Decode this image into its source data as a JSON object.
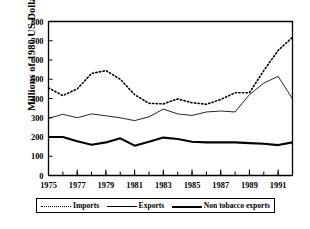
{
  "chart_data": {
    "type": "line",
    "title": "",
    "xlabel": "",
    "ylabel": "Millions of 1980 US Dollars",
    "xlim": [
      1975,
      1992
    ],
    "ylim": [
      0,
      800
    ],
    "ytick_step": 100,
    "xtick_step": 1,
    "xtick_label_step": 2,
    "grid": false,
    "legend_position": "below-plot",
    "yticks": [
      "0",
      "100",
      "200",
      "300",
      "400",
      "500",
      "600",
      "700",
      "800"
    ],
    "xticks": [
      "1975",
      "1977",
      "1979",
      "1981",
      "1983",
      "1985",
      "1987",
      "1989",
      "1991"
    ],
    "x": [
      1975,
      1976,
      1977,
      1978,
      1979,
      1980,
      1981,
      1982,
      1983,
      1984,
      1985,
      1986,
      1987,
      1988,
      1989,
      1990,
      1991,
      1992
    ],
    "series": [
      {
        "name": "Imports",
        "style": "dotted",
        "values": [
          455,
          415,
          450,
          530,
          545,
          500,
          420,
          375,
          372,
          398,
          378,
          370,
          395,
          430,
          430,
          545,
          650,
          718
        ]
      },
      {
        "name": "Exports",
        "style": "thin-solid",
        "values": [
          297,
          318,
          300,
          320,
          310,
          300,
          285,
          305,
          345,
          320,
          312,
          330,
          335,
          330,
          420,
          480,
          515,
          398
        ]
      },
      {
        "name": "Non tobacco exports",
        "style": "thick-solid",
        "values": [
          200,
          200,
          178,
          160,
          172,
          193,
          155,
          175,
          197,
          190,
          175,
          172,
          172,
          172,
          168,
          165,
          158,
          172
        ]
      }
    ]
  },
  "legend": {
    "items": [
      {
        "label": "Imports",
        "style": "dotted"
      },
      {
        "label": "Exports",
        "style": "thin-solid"
      },
      {
        "label": "Non tobacco exports",
        "style": "thick-solid"
      }
    ]
  },
  "colors": {
    "axis": "#000000",
    "background": "#ffffff",
    "series": "#000000"
  }
}
